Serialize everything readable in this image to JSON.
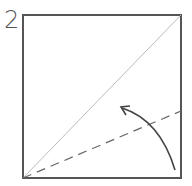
{
  "step": {
    "number": "2"
  },
  "diagram": {
    "type": "origami-fold-step",
    "square": {
      "x": 23,
      "y": 15,
      "size": 158,
      "stroke": "#555555"
    },
    "diagonal_crease": {
      "from": [
        23,
        178
      ],
      "to": [
        181,
        15
      ],
      "stroke": "#bbbbbb",
      "style": "solid"
    },
    "valley_fold_line": {
      "from": [
        23,
        178
      ],
      "to": [
        181,
        111
      ],
      "stroke": "#666666",
      "style": "dashed"
    },
    "fold_arrow": {
      "from": [
        175,
        170
      ],
      "to": [
        121,
        107
      ],
      "stroke": "#444444",
      "direction": "curved-up-left"
    }
  }
}
